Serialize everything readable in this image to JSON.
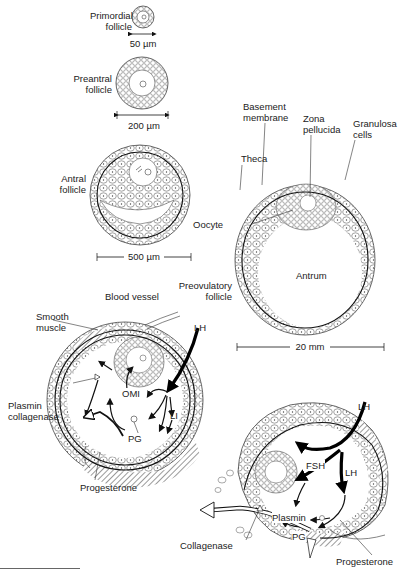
{
  "figure": {
    "stages": [
      {
        "id": "primordial",
        "label_lines": [
          "Primordial",
          "follicle"
        ],
        "scale": "50 µm"
      },
      {
        "id": "preantral",
        "label_lines": [
          "Preantral",
          "follicle"
        ],
        "scale": "200 µm"
      },
      {
        "id": "antral",
        "label_lines": [
          "Antral",
          "follicle"
        ],
        "scale": "500 µm"
      },
      {
        "id": "preovulatory",
        "label_lines": [
          "Preovulatory",
          "follicle"
        ],
        "scale": "20 mm"
      }
    ],
    "preovulatory_parts": {
      "basement_membrane": [
        "Basement",
        "membrane"
      ],
      "zona_pellucida": [
        "Zona",
        "pellucida"
      ],
      "granulosa_cells": [
        "Granulosa",
        "cells"
      ],
      "theca": "Theca",
      "oocyte": "Oocyte",
      "antrum": "Antrum"
    },
    "ovulation_left": {
      "blood_vessel": "Blood vessel",
      "smooth_muscle": [
        "Smooth",
        "muscle"
      ],
      "lh": "LH",
      "omi": "OMI",
      "li": "LI",
      "pg": "PG",
      "plasmin_collagenase": [
        "Plasmin",
        "collagenase"
      ],
      "progesterone": "Progesterone"
    },
    "ovulation_right": {
      "lh_top": "LH",
      "fsh": "FSH",
      "lh_inner": "LH",
      "plasmin": "Plasmin",
      "pg": "PG",
      "collagenase": "Collagenase",
      "progesterone": "Progesterone"
    }
  }
}
